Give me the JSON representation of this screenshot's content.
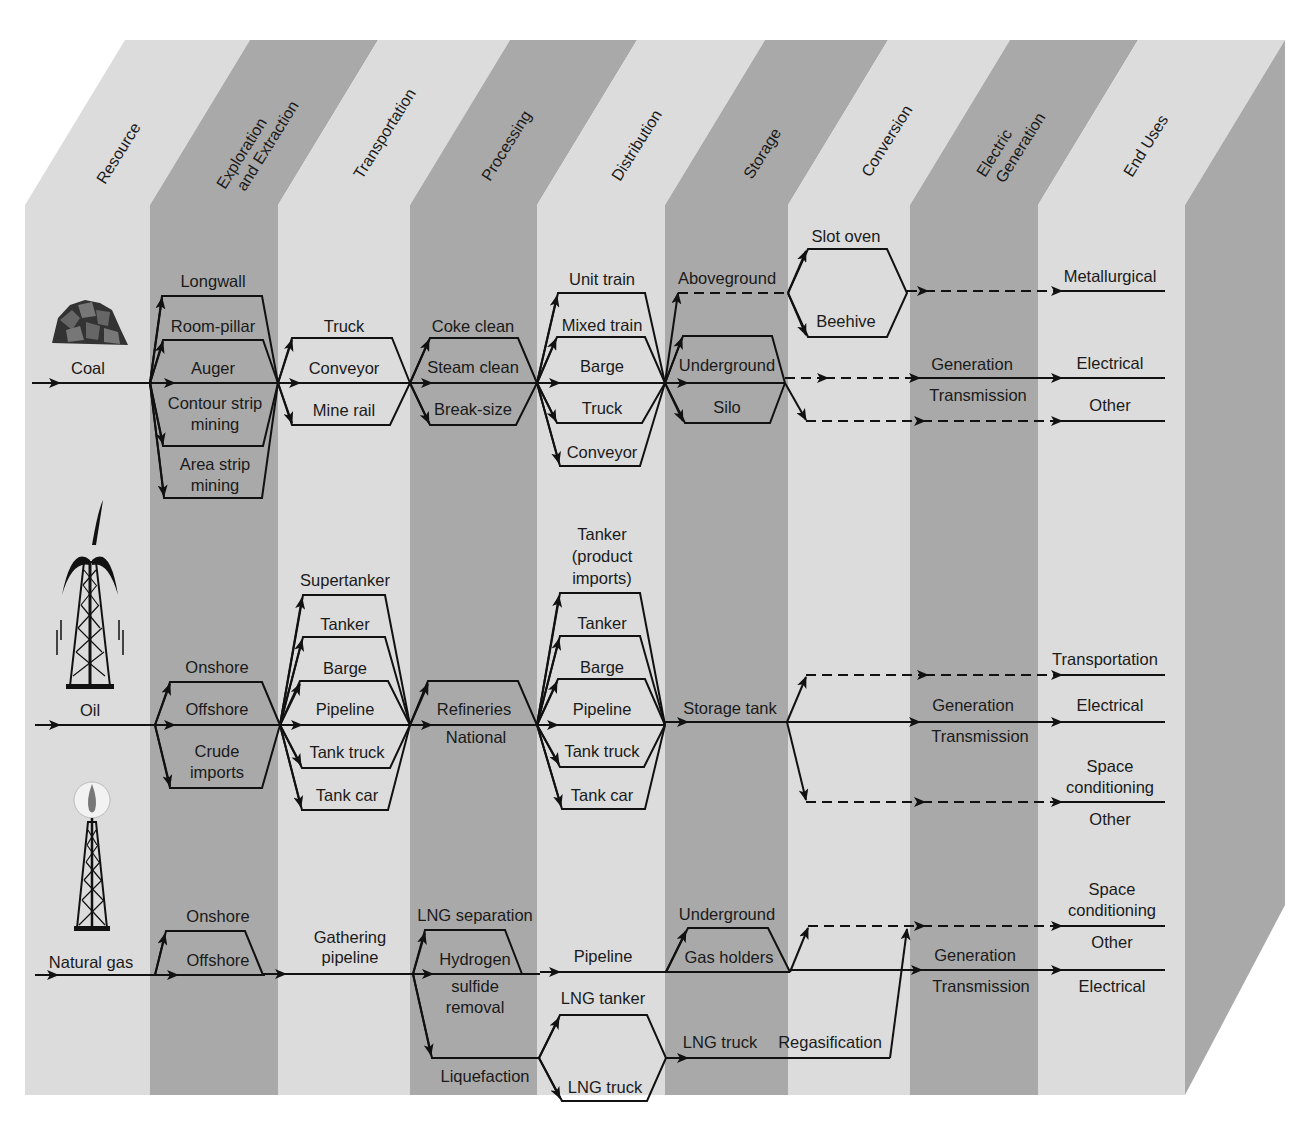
{
  "figure": {
    "colors": {
      "band_light": "#dcdcdc",
      "band_dark": "#a9a9a9",
      "line": "#111111",
      "background": "#ffffff"
    },
    "columns": [
      {
        "label": "Resource",
        "shade": "light"
      },
      {
        "label": "Exploration and Extraction",
        "line1": "Exploration",
        "line2": "and Extraction",
        "shade": "dark"
      },
      {
        "label": "Transportation",
        "shade": "light"
      },
      {
        "label": "Processing",
        "shade": "dark"
      },
      {
        "label": "Distribution",
        "shade": "light"
      },
      {
        "label": "Storage",
        "shade": "dark"
      },
      {
        "label": "Conversion",
        "shade": "light"
      },
      {
        "label": "Electric Generation",
        "line1": "Electric",
        "line2": "Generation",
        "shade": "dark"
      },
      {
        "label": "End Uses",
        "shade": "light"
      }
    ],
    "coal": {
      "resource": "Coal",
      "icon": "coal-pile-icon",
      "extraction": [
        "Longwall",
        "Room-pillar",
        "Auger",
        "Contour strip",
        "mining",
        "Area strip",
        "mining"
      ],
      "transportation": [
        "Truck",
        "Conveyor",
        "Mine rail"
      ],
      "processing": [
        "Coke clean",
        "Steam clean",
        "Break-size"
      ],
      "distribution": [
        "Unit train",
        "Mixed train",
        "Barge",
        "Truck",
        "Conveyor"
      ],
      "storage": [
        "Aboveground",
        "Underground",
        "Silo"
      ],
      "conversion": [
        "Slot oven",
        "Beehive"
      ],
      "electric_generation": [
        "Generation",
        "Transmission"
      ],
      "end_uses": [
        "Metallurgical",
        "Electrical",
        "Other"
      ]
    },
    "oil": {
      "resource": "Oil",
      "icon": "oil-gusher-derrick-icon",
      "extraction": [
        "Onshore",
        "Offshore",
        "Crude",
        "imports"
      ],
      "transportation": [
        "Supertanker",
        "Tanker",
        "Barge",
        "Pipeline",
        "Tank truck",
        "Tank car"
      ],
      "processing": [
        "Refineries",
        "National"
      ],
      "distribution": [
        "Tanker",
        "(product",
        "imports)",
        "Tanker",
        "Barge",
        "Pipeline",
        "Tank truck",
        "Tank car"
      ],
      "storage": [
        "Storage tank"
      ],
      "electric_generation": [
        "Generation",
        "Transmission"
      ],
      "end_uses": [
        "Transportation",
        "Electrical",
        "Space",
        "conditioning",
        "Other"
      ]
    },
    "gas": {
      "resource": "Natural gas",
      "icon": "gas-flare-derrick-icon",
      "extraction": [
        "Onshore",
        "Offshore"
      ],
      "transportation": [
        "Gathering",
        "pipeline"
      ],
      "processing": [
        "LNG separation",
        "Hydrogen",
        "sulfide",
        "removal",
        "Liquefaction"
      ],
      "distribution": [
        "Pipeline",
        "LNG tanker",
        "LNG truck"
      ],
      "storage": [
        "Underground",
        "Gas holders",
        "LNG truck"
      ],
      "conversion": [
        "Regasification"
      ],
      "electric_generation": [
        "Generation",
        "Transmission"
      ],
      "end_uses": [
        "Space",
        "conditioning",
        "Other",
        "Electrical"
      ]
    }
  }
}
